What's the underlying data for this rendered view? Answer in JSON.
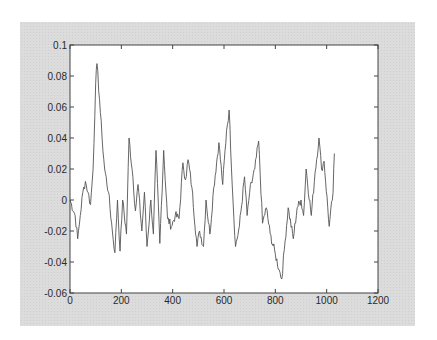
{
  "chart_data": {
    "type": "line",
    "title": "",
    "xlabel": "",
    "ylabel": "",
    "xlim": [
      0,
      1200
    ],
    "ylim": [
      -0.06,
      0.1
    ],
    "grid": false,
    "legend": null,
    "x_ticks": [
      "0",
      "200",
      "400",
      "600",
      "800",
      "1000",
      "1200"
    ],
    "y_ticks": [
      "0.1",
      "0.08",
      "0.06",
      "0.04",
      "0.02",
      "0",
      "-0.02",
      "-0.04",
      "-0.06"
    ],
    "series": [
      {
        "name": "signal",
        "color": "#555555",
        "x": [
          0,
          20,
          30,
          40,
          50,
          60,
          70,
          80,
          90,
          100,
          105,
          115,
          125,
          135,
          150,
          165,
          175,
          185,
          195,
          205,
          220,
          230,
          245,
          255,
          265,
          280,
          290,
          300,
          315,
          325,
          335,
          350,
          365,
          380,
          395,
          410,
          425,
          440,
          450,
          460,
          475,
          495,
          505,
          520,
          530,
          545,
          560,
          580,
          595,
          610,
          620,
          635,
          645,
          660,
          680,
          690,
          700,
          720,
          735,
          750,
          765,
          780,
          800,
          815,
          825,
          835,
          850,
          870,
          885,
          900,
          910,
          920,
          940,
          955,
          970,
          980,
          990,
          1010,
          1025,
          1030
        ],
        "values": [
          0,
          -0.01,
          -0.025,
          -0.01,
          0.005,
          0.012,
          0.005,
          -0.003,
          0.02,
          0.075,
          0.088,
          0.065,
          0.04,
          0.02,
          0.005,
          -0.02,
          -0.034,
          0,
          -0.033,
          0,
          -0.022,
          0.04,
          0.015,
          -0.007,
          0.01,
          -0.02,
          0.005,
          -0.03,
          0,
          -0.022,
          0.032,
          -0.028,
          0.032,
          -0.012,
          -0.017,
          -0.01,
          -0.012,
          0.024,
          0.013,
          0.026,
          0.008,
          -0.03,
          -0.02,
          -0.03,
          0,
          -0.022,
          0.008,
          0.037,
          0.01,
          0.045,
          0.058,
          0,
          -0.03,
          -0.017,
          0.015,
          -0.01,
          0.005,
          0.02,
          0.038,
          -0.015,
          -0.005,
          -0.022,
          -0.035,
          -0.045,
          -0.051,
          -0.032,
          -0.005,
          -0.025,
          -0.005,
          0,
          -0.01,
          0.02,
          -0.01,
          0.018,
          0.04,
          0.02,
          0.025,
          -0.017,
          0.005,
          0.03
        ]
      }
    ]
  },
  "colors": {
    "panel_background": "#dcdcdc",
    "plot_background": "#ffffff",
    "axes": "#444444",
    "line": "#555555"
  }
}
